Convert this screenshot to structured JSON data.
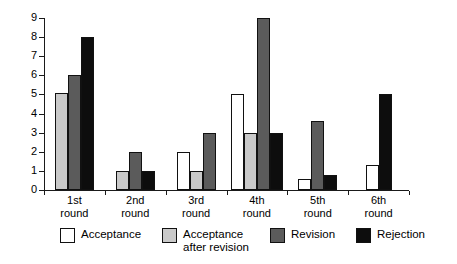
{
  "chart_data": {
    "type": "bar",
    "title": "",
    "subtitle": "",
    "xlabel": "",
    "ylabel": "",
    "ylim": [
      0,
      9
    ],
    "yticks": [
      "0",
      "1",
      "2",
      "3",
      "4",
      "5",
      "6",
      "7",
      "8",
      "9"
    ],
    "grid": false,
    "legend_position": "bottom",
    "categories": [
      "1st\nround",
      "2nd\nround",
      "3rd\nround",
      "4th\nround",
      "5th\nround",
      "6th\nround"
    ],
    "series": [
      {
        "name": "Acceptance",
        "color": "#ffffff",
        "values": [
          0,
          0,
          2,
          5,
          0.6,
          1.3
        ]
      },
      {
        "name": "Acceptance\nafter revision",
        "color": "#c9c9c9",
        "values": [
          5.1,
          1,
          1,
          3,
          0,
          0
        ]
      },
      {
        "name": "Revision",
        "color": "#5b5b5b",
        "values": [
          6,
          2,
          3,
          9,
          3.6,
          0
        ]
      },
      {
        "name": "Rejection",
        "color": "#0d0d0d",
        "values": [
          8,
          1,
          0,
          3,
          0.8,
          5
        ]
      }
    ]
  }
}
